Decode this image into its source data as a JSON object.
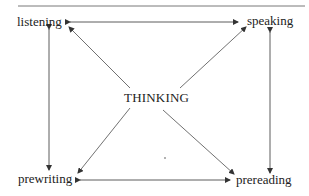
{
  "diagram": {
    "center_label": "THINKING",
    "nodes": {
      "top_left": "listening",
      "top_right": "speaking",
      "bottom_left": "prewriting",
      "bottom_right": "prereading"
    },
    "edges": [
      {
        "from": "listening",
        "to": "speaking",
        "type": "bidirectional"
      },
      {
        "from": "listening",
        "to": "prewriting",
        "type": "bidirectional"
      },
      {
        "from": "speaking",
        "to": "prereading",
        "type": "bidirectional"
      },
      {
        "from": "prewriting",
        "to": "prereading",
        "type": "bidirectional"
      },
      {
        "from": "THINKING",
        "to": "listening",
        "type": "directed"
      },
      {
        "from": "THINKING",
        "to": "speaking",
        "type": "directed"
      },
      {
        "from": "THINKING",
        "to": "prewriting",
        "type": "directed"
      },
      {
        "from": "THINKING",
        "to": "prereading",
        "type": "directed"
      }
    ],
    "line_color": "#333333"
  }
}
